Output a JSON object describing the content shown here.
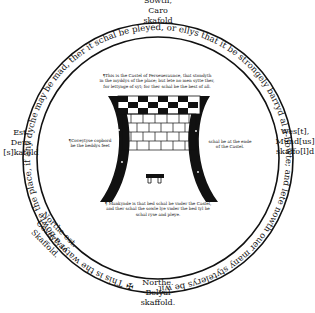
{
  "diagram": {
    "scaffolds": {
      "south": {
        "line1": "Sowth,",
        "line2": "Caro",
        "line3": "skafold"
      },
      "east": {
        "line1": "Est.",
        "line2": "Deus",
        "line3": "[s]kafold"
      },
      "west": {
        "line1": "Wes[t],",
        "line2": "Mund[us]",
        "line3": "skaffo[l]d"
      },
      "north": {
        "line1": "Northe.",
        "line2": "Belyal",
        "line3": "skaffold."
      },
      "northeast": {
        "line1": "Northe-est.",
        "line2": "Coveytyse",
        "line3": "Skaffold."
      }
    },
    "ring_text": "This is the watyr a-bowte the place, if any dyche may be mad, ther it schal be pleyed, or ellys that it be strongely barryd al a-bowte; and lete nowth ouer many stytelerys be with-inne the place.",
    "ring_marker": "✠",
    "notes": {
      "castle_top": "¶This is the Castel of Perseueraunce, that stondyth in the mydylys of the place; but lete no men sytte ther, for lettynge of syt; for ther schal be the best of all.",
      "castle_top_lines": [
        "¶This is the Castel of Perseueraunce, that stondyth",
        "in the myddys of the place; but lete no men sytte ther,",
        "for lettynge of syt; for ther schal be the best of all."
      ],
      "left_lines": [
        "¶Coveytyse copbord",
        "be the beddys feet"
      ],
      "right_lines": [
        "schal be at the ende",
        "of the Castel."
      ],
      "bottom_lines": [
        "¶ Mankynde is that bed schal be vnder the Castel,",
        "and ther schal the sowle lye vnder the bed tyl he",
        "schal ryse and pleye."
      ]
    },
    "colors": {
      "ink": "#111111",
      "paper": "#ffffff"
    }
  }
}
